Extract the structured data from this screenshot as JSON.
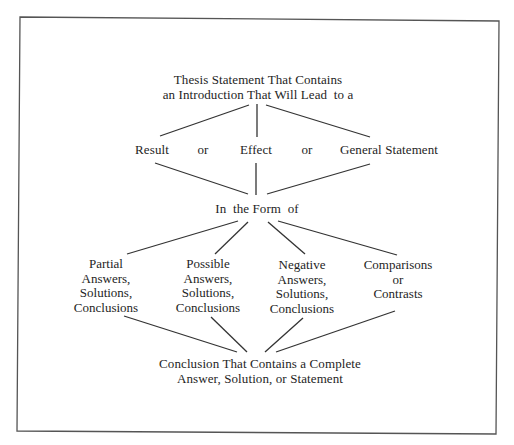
{
  "diagram": {
    "title_node": {
      "line1": "Thesis Statement That Contains",
      "line2": "an Introduction That Will Lead  to a"
    },
    "middle_row": {
      "items": [
        "Result",
        "Effect",
        "General Statement"
      ],
      "connector": "or"
    },
    "junction_label": "In  the Form  of",
    "columns": [
      {
        "lines": [
          "Partial",
          "Answers,",
          "Solutions,",
          "Conclusions"
        ]
      },
      {
        "lines": [
          "Possible",
          "Answers,",
          "Solutions,",
          "Conclusions"
        ]
      },
      {
        "lines": [
          "Negative",
          "Answers,",
          "Solutions,",
          "Conclusions"
        ]
      },
      {
        "lines": [
          "Comparisons",
          "or",
          "Contrasts"
        ]
      }
    ],
    "conclusion_node": {
      "line1": "Conclusion That Contains a Complete",
      "line2": "Answer, Solution, or Statement"
    },
    "colors": {
      "text": "#1e1e1e",
      "lines": "#333333",
      "border": "#555555",
      "background": "#ffffff"
    }
  }
}
